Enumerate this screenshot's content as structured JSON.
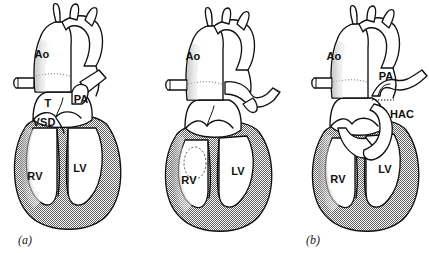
{
  "figure": {
    "background_color": "#ffffff",
    "line_color": "#111111",
    "myocardium_fill_color": "#9a9a9a"
  },
  "panels": [
    {
      "id": "a",
      "caption": "(a)",
      "description": "Preoperative anatomy: truncus arteriosus with ventricular septal defect",
      "labels": [
        {
          "name": "aorta",
          "text": "Ao",
          "x": 42,
          "y": 58
        },
        {
          "name": "truncus",
          "text": "T",
          "x": 48,
          "y": 107
        },
        {
          "name": "pulmonary-artery",
          "text": "PA",
          "x": 79,
          "y": 103
        },
        {
          "name": "ventricular-septal-defect",
          "text": "VSD",
          "x": 40,
          "y": 125
        },
        {
          "name": "right-ventricle",
          "text": "RV",
          "x": 33,
          "y": 179
        },
        {
          "name": "left-ventricle",
          "text": "LV",
          "x": 78,
          "y": 172
        }
      ]
    },
    {
      "id": "b",
      "caption": "(b)",
      "description": "Pulmonary artery detached from the trunk; ventricular septal defect closed with a patch",
      "labels": [
        {
          "name": "aorta",
          "text": "Ao",
          "x": 48,
          "y": 60
        },
        {
          "name": "right-ventricle",
          "text": "RV",
          "x": 44,
          "y": 182
        },
        {
          "name": "left-ventricle",
          "text": "LV",
          "x": 93,
          "y": 175
        }
      ]
    },
    {
      "id": "c",
      "caption": "(c)",
      "description": "Completed repair: valved extracardiac conduit from right ventricle to pulmonary artery",
      "labels": [
        {
          "name": "aorta",
          "text": "Ao",
          "x": 45,
          "y": 59
        },
        {
          "name": "pulmonary-artery",
          "text": "PA",
          "x": 98,
          "y": 79
        },
        {
          "name": "homograft-apical-conduit",
          "text": "HAC",
          "x": 110,
          "y": 116
        },
        {
          "name": "right-ventricle",
          "text": "RV",
          "x": 51,
          "y": 181
        },
        {
          "name": "left-ventricle",
          "text": "LV",
          "x": 97,
          "y": 172
        }
      ]
    }
  ]
}
